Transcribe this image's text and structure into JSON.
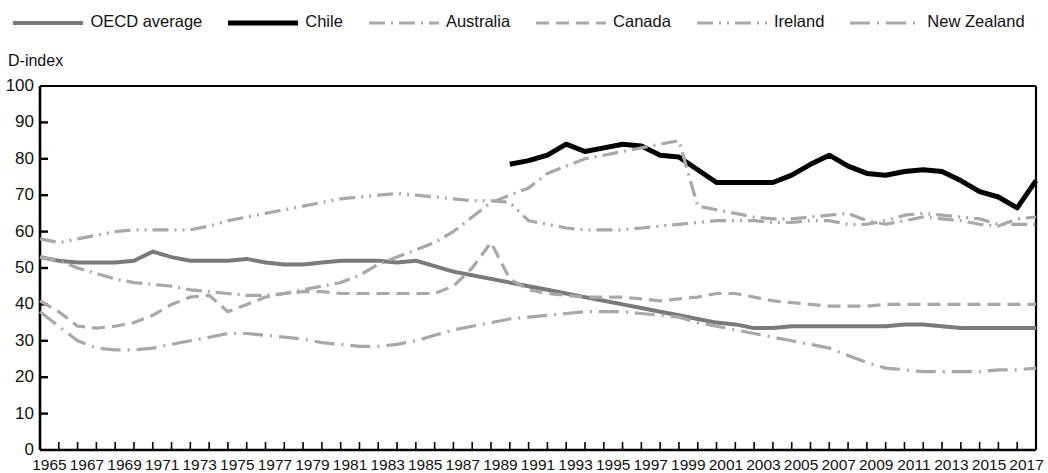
{
  "legend": {
    "position": "top",
    "items": [
      {
        "name": "OECD average",
        "style": "solid",
        "color": "#7a7a7a",
        "width": 4
      },
      {
        "name": "Chile",
        "style": "solid",
        "color": "#000000",
        "width": 5
      },
      {
        "name": "Australia",
        "style": "dash-dot",
        "color": "#a8a8a8",
        "width": 3
      },
      {
        "name": "Canada",
        "style": "dashed",
        "color": "#a8a8a8",
        "width": 3
      },
      {
        "name": "Ireland",
        "style": "dash-dot-dot",
        "color": "#a8a8a8",
        "width": 3
      },
      {
        "name": "New Zealand",
        "style": "long-dash-dot",
        "color": "#a8a8a8",
        "width": 3
      }
    ]
  },
  "axes": {
    "y_title": "D-index",
    "y_ticks": [
      100,
      90,
      80,
      70,
      60,
      50,
      40,
      30,
      20,
      10,
      0
    ],
    "y_min": 0,
    "y_max": 100,
    "x_min": 1965,
    "x_max": 2018,
    "x_ticks": [
      1965,
      1967,
      1969,
      1971,
      1973,
      1975,
      1977,
      1979,
      1981,
      1983,
      1985,
      1987,
      1989,
      1991,
      1993,
      1995,
      1997,
      1999,
      2001,
      2003,
      2005,
      2007,
      2009,
      2011,
      2013,
      2015,
      2017
    ],
    "grid": false
  },
  "chart_data": {
    "type": "line",
    "title": "",
    "xlabel": "",
    "ylabel": "D-index",
    "ylim": [
      0,
      100
    ],
    "xlim": [
      1965,
      2018
    ],
    "x": [
      1965,
      1966,
      1967,
      1968,
      1969,
      1970,
      1971,
      1972,
      1973,
      1974,
      1975,
      1976,
      1977,
      1978,
      1979,
      1980,
      1981,
      1982,
      1983,
      1984,
      1985,
      1986,
      1987,
      1988,
      1989,
      1990,
      1991,
      1992,
      1993,
      1994,
      1995,
      1996,
      1997,
      1998,
      1999,
      2000,
      2001,
      2002,
      2003,
      2004,
      2005,
      2006,
      2007,
      2008,
      2009,
      2010,
      2011,
      2012,
      2013,
      2014,
      2015,
      2016,
      2017,
      2018
    ],
    "series": [
      {
        "name": "OECD average",
        "style": "solid",
        "color": "#7a7a7a",
        "values": [
          53,
          52,
          51.5,
          51.5,
          51.5,
          52,
          54.5,
          53,
          52,
          52,
          52,
          52.5,
          51.5,
          51,
          51,
          51.5,
          52,
          52,
          52,
          51.5,
          52,
          50.5,
          49,
          48,
          47,
          46,
          45,
          44,
          43,
          42,
          41,
          40,
          39,
          38,
          37,
          36,
          35,
          34.5,
          33.5,
          33.5,
          34,
          34,
          34,
          34,
          34,
          34,
          34.5,
          34.5,
          34,
          33.5,
          33.5,
          33.5,
          33.5,
          33.5
        ]
      },
      {
        "name": "Chile",
        "style": "solid",
        "color": "#000000",
        "values": [
          null,
          null,
          null,
          null,
          null,
          null,
          null,
          null,
          null,
          null,
          null,
          null,
          null,
          null,
          null,
          null,
          null,
          null,
          null,
          null,
          null,
          null,
          null,
          null,
          null,
          78.5,
          79.5,
          81,
          84,
          82,
          83,
          84,
          83.5,
          81,
          80.5,
          77,
          73.5,
          73.5,
          73.5,
          73.5,
          75.5,
          78.5,
          81,
          78,
          76,
          75.5,
          76.5,
          77,
          76.5,
          74,
          71,
          69.5,
          66.5,
          74
        ]
      },
      {
        "name": "Australia",
        "style": "dash-dot",
        "color": "#a8a8a8",
        "values": [
          53,
          52,
          50,
          48.5,
          47,
          46,
          45.5,
          45,
          44,
          43.5,
          43,
          42.5,
          42.5,
          43,
          44,
          45,
          46,
          48,
          51,
          53,
          55,
          57,
          60,
          64,
          68,
          70,
          72,
          76,
          78,
          80,
          81,
          82,
          83,
          84,
          85,
          67,
          66,
          65,
          64,
          63.5,
          63.5,
          64,
          64.5,
          65,
          63,
          62,
          63,
          64,
          63.5,
          63,
          62,
          61.5,
          63.5,
          64
        ]
      },
      {
        "name": "Canada",
        "style": "dashed",
        "color": "#a8a8a8",
        "values": [
          41,
          38,
          34,
          33.5,
          34,
          35,
          37,
          40,
          42,
          42.5,
          38,
          40,
          42,
          43,
          43.5,
          43.5,
          43,
          43,
          43,
          43,
          43,
          43,
          45,
          50,
          57,
          47,
          44,
          43,
          42.5,
          42,
          42,
          42,
          41.5,
          41,
          41.5,
          42,
          43,
          43,
          42,
          41,
          40.5,
          40,
          39.5,
          39.5,
          39.5,
          40,
          40,
          40,
          40,
          40,
          40,
          40,
          40,
          40
        ]
      },
      {
        "name": "Ireland",
        "style": "dash-dot-dot",
        "color": "#a8a8a8",
        "values": [
          58,
          57,
          58,
          59,
          60,
          60.5,
          60.5,
          60.5,
          60.5,
          61.5,
          63,
          64,
          65,
          66,
          67,
          68,
          69,
          69.5,
          70,
          70.5,
          70,
          69.5,
          69,
          68.5,
          68.5,
          68,
          63,
          62,
          61,
          60.5,
          60.5,
          60.5,
          61,
          61.5,
          62,
          62.5,
          63,
          63,
          63,
          62.5,
          62.5,
          63,
          63,
          62,
          62,
          63,
          64.5,
          65,
          64.5,
          64,
          63.5,
          62,
          62,
          62
        ]
      },
      {
        "name": "New Zealand",
        "style": "long-dash-dot",
        "color": "#a8a8a8",
        "values": [
          38,
          34,
          30,
          28,
          27.5,
          27.5,
          28,
          29,
          30,
          31,
          32,
          32,
          31.5,
          31,
          30.5,
          29.5,
          29,
          28.5,
          28.5,
          29,
          30,
          31.5,
          33,
          34,
          35,
          36,
          36.5,
          37,
          37.5,
          38,
          38,
          38,
          37.5,
          37,
          36.5,
          35,
          34,
          33,
          32,
          31,
          30,
          29,
          28,
          26,
          24,
          22.5,
          22,
          21.5,
          21.5,
          21.5,
          21.5,
          22,
          22,
          22.5
        ]
      }
    ]
  }
}
